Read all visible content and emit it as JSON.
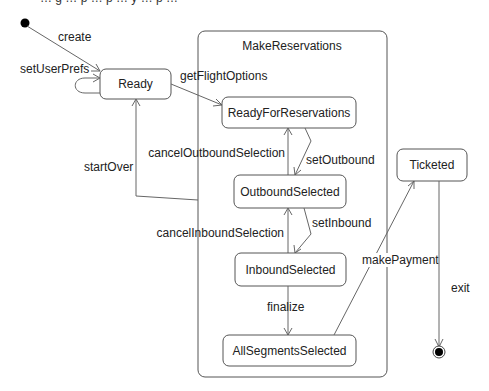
{
  "diagram": {
    "type": "UML state machine",
    "top_cut_text": "… g … p … p … y … p …",
    "composite_state": {
      "name": "MakeReservations"
    },
    "states": {
      "ready": "Ready",
      "ready_for_reservations": "ReadyForReservations",
      "outbound_selected": "OutboundSelected",
      "inbound_selected": "InboundSelected",
      "all_segments_selected": "AllSegmentsSelected",
      "ticketed": "Ticketed"
    },
    "transitions": {
      "create": "create",
      "set_user_prefs": "setUserPrefs",
      "get_flight_options": "getFlightOptions",
      "start_over": "startOver",
      "cancel_outbound_selection": "cancelOutboundSelection",
      "set_outbound": "setOutbound",
      "cancel_inbound_selection": "cancelInboundSelection",
      "set_inbound": "setInbound",
      "finalize": "finalize",
      "make_payment": "makePayment",
      "exit": "exit"
    },
    "colors": {
      "line": "#666666",
      "box_stroke": "#555555",
      "text": "#222222",
      "background": "#ffffff"
    }
  }
}
